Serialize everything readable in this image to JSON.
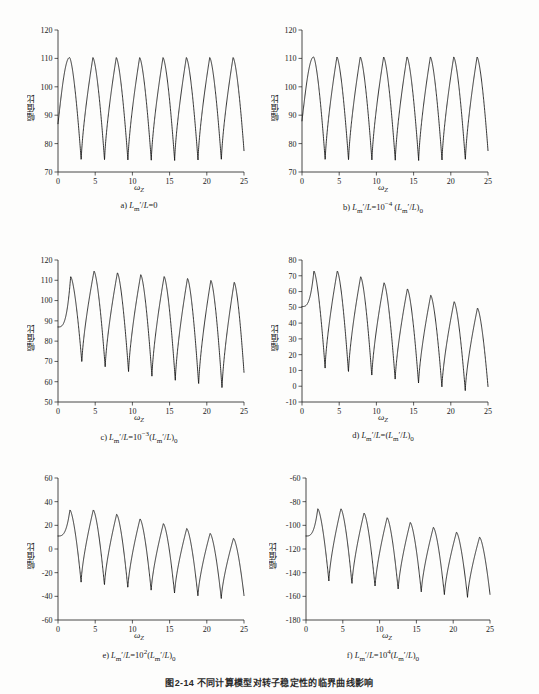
{
  "figure": {
    "caption": "图2-14  不同计算模型对转子稳定性的临界曲线影响",
    "panel_count": 6
  },
  "axes": {
    "ylabel": "幅值比",
    "xlabel_base": "ω",
    "xlabel_sub": "Z",
    "xticks": [
      0,
      5,
      10,
      15,
      20,
      25
    ],
    "xlim": [
      0,
      25
    ]
  },
  "chart_data": [
    {
      "id": "a",
      "type": "line",
      "title": "a) L'm/L=0",
      "caption_html": "a) <i>L</i><sub>m</sub>&prime;/<i>L</i>=0",
      "xlabel": "ωZ",
      "ylabel": "幅值比",
      "xlim": [
        0,
        25
      ],
      "ylim": [
        70,
        120
      ],
      "yticks": [
        70,
        80,
        90,
        100,
        110,
        120
      ],
      "xticks": [
        0,
        5,
        10,
        15,
        20,
        25
      ],
      "grid": false,
      "legend": "none",
      "params": {
        "shape": "symmetric-comb",
        "peak_value": 110.3,
        "trough_value": 74.0,
        "period": 3.14,
        "first_peak_x": 1.55,
        "start_value": 87.0,
        "peak_decay": 0.0,
        "trough_decay": 0.0
      }
    },
    {
      "id": "b",
      "type": "line",
      "title": "b) L'm/L=10^-4 (L'm/L)0",
      "caption_html": "b) <i>L</i><sub>m</sub>&prime;/<i>L</i>=10<sup>&minus;4</sup> (<i>L</i><sub>m</sub>&prime;/<i>L</i>)<sub>0</sub>",
      "xlabel": "ωZ",
      "ylabel": "幅值比",
      "xlim": [
        0,
        25
      ],
      "ylim": [
        70,
        120
      ],
      "yticks": [
        70,
        80,
        90,
        100,
        110,
        120
      ],
      "xticks": [
        0,
        5,
        10,
        15,
        20,
        25
      ],
      "grid": false,
      "legend": "none",
      "params": {
        "shape": "symmetric-comb",
        "peak_value": 110.5,
        "trough_value": 74.0,
        "period": 3.14,
        "first_peak_x": 1.55,
        "start_value": 88.0,
        "peak_decay": 0.0,
        "trough_decay": 0.0
      }
    },
    {
      "id": "c",
      "type": "line",
      "title": "c) L'm/L=10^-3 (L'm/L)0",
      "caption_html": "c) <i>L</i><sub>m</sub>&prime;/<i>L</i>=10<sup>&minus;3</sup>(<i>L</i><sub>m</sub>&prime;/<i>L</i>)<sub>0</sub>",
      "xlabel": "ωZ",
      "ylabel": "幅值比",
      "xlim": [
        0,
        25
      ],
      "ylim": [
        50,
        120
      ],
      "yticks": [
        50,
        60,
        70,
        80,
        90,
        100,
        110,
        120
      ],
      "xticks": [
        0,
        5,
        10,
        15,
        20,
        25
      ],
      "grid": false,
      "legend": "none",
      "params": {
        "shape": "sawtooth-decay",
        "peak_first": 111.8,
        "peak_max": 114.5,
        "peak_last": 109.0,
        "trough_first": 69.5,
        "trough_last": 54.5,
        "period": 3.14,
        "first_peak_x": 1.7,
        "start_value": 87.0
      }
    },
    {
      "id": "d",
      "type": "line",
      "title": "d) L'm/L=(L'm/L)0",
      "caption_html": "d) <i>L</i><sub>m</sub>&prime;/<i>L</i>=(<i>L</i><sub>m</sub>&prime;/<i>L</i>)<sub>0</sub>",
      "xlabel": "ωZ",
      "ylabel": "幅值比",
      "xlim": [
        0,
        25
      ],
      "ylim": [
        -10,
        80
      ],
      "yticks": [
        -10,
        0,
        10,
        20,
        30,
        40,
        50,
        60,
        70,
        80
      ],
      "xticks": [
        0,
        5,
        10,
        15,
        20,
        25
      ],
      "grid": false,
      "legend": "none",
      "params": {
        "shape": "sawtooth-decay",
        "peak_first": 73.0,
        "peak_max": 73.0,
        "peak_last": 49.5,
        "trough_first": 11.5,
        "trough_last": -5.0,
        "period": 3.14,
        "first_peak_x": 1.6,
        "start_value": 50.5
      }
    },
    {
      "id": "e",
      "type": "line",
      "title": "e) L'm/L=10^2 (L'm/L)0",
      "caption_html": "e) <i>L</i><sub>m</sub>&prime;/<i>L</i>=10<sup>2</sup>(<i>L</i><sub>m</sub>&prime;/<i>L</i>)<sub>0</sub>",
      "xlabel": "ωZ",
      "ylabel": "幅值比",
      "xlim": [
        0,
        25
      ],
      "ylim": [
        -60,
        60
      ],
      "yticks": [
        -60,
        -40,
        -20,
        0,
        20,
        40,
        60
      ],
      "grid": false,
      "legend": "none",
      "xticks": [
        0,
        5,
        10,
        15,
        20,
        25
      ],
      "params": {
        "shape": "sawtooth-decay",
        "peak_first": 33.0,
        "peak_max": 33.0,
        "peak_last": 9.0,
        "trough_first": -28.0,
        "trough_last": -44.0,
        "period": 3.14,
        "first_peak_x": 1.6,
        "start_value": 11.0
      }
    },
    {
      "id": "f",
      "type": "line",
      "title": "f) L'm/L=10^4 (L'm/L)0",
      "caption_html": "f) <i>L</i><sub>m</sub>&prime;/<i>L</i>=10<sup>4</sup>(<i>L</i><sub>m</sub>&prime;/<i>L</i>)<sub>0</sub>",
      "xlabel": "ωZ",
      "ylabel": "幅值比",
      "xlim": [
        0,
        25
      ],
      "ylim": [
        -180,
        -60
      ],
      "yticks": [
        -180,
        -160,
        -140,
        -120,
        -100,
        -80,
        -60
      ],
      "grid": false,
      "legend": "none",
      "xticks": [
        0,
        5,
        10,
        15,
        20,
        25
      ],
      "params": {
        "shape": "sawtooth-decay",
        "peak_first": -86.0,
        "peak_max": -86.0,
        "peak_last": -110.0,
        "trough_first": -147.0,
        "trough_last": -163.0,
        "period": 3.14,
        "first_peak_x": 1.6,
        "start_value": -109.0
      }
    }
  ]
}
